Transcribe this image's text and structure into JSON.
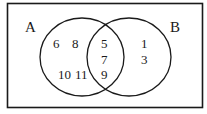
{
  "diagram": {
    "type": "venn",
    "colors": {
      "background": "#ffffff",
      "stroke": "#1a1a1a",
      "text": "#1a1a1a"
    },
    "sets": [
      {
        "id": "A",
        "label": "A"
      },
      {
        "id": "B",
        "label": "B"
      }
    ],
    "regions": {
      "a_only": [
        "6",
        "8",
        "10",
        "11"
      ],
      "intersection": [
        "5",
        "7",
        "9"
      ],
      "b_only": [
        "1",
        "3"
      ]
    }
  }
}
